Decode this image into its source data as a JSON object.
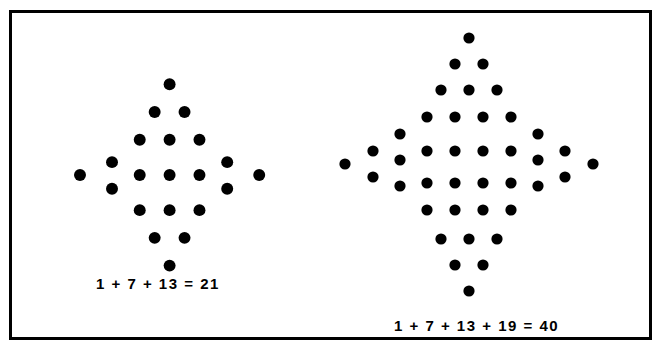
{
  "page": {
    "width": 670,
    "height": 357,
    "background_color": "#ffffff",
    "border_color": "#000000",
    "dot_color": "#000000"
  },
  "figures": [
    {
      "name": "centered-hexagonal-diamond-21",
      "caption": "1 + 7 + 13 = 21",
      "dot_count": 21,
      "dot_radius": 5.6,
      "ring_terms": [
        1,
        7,
        13
      ],
      "sum": 21,
      "origin": {
        "x": 159,
        "y": 164
      },
      "spacing": {
        "dx": 28,
        "dy": 25
      },
      "dots": [
        {
          "x": 159,
          "y": 79
        },
        {
          "x": 145,
          "y": 105
        },
        {
          "x": 173,
          "y": 105
        },
        {
          "x": 131,
          "y": 131
        },
        {
          "x": 159,
          "y": 131
        },
        {
          "x": 187,
          "y": 131
        },
        {
          "x": 105,
          "y": 152
        },
        {
          "x": 105,
          "y": 177
        },
        {
          "x": 213,
          "y": 152
        },
        {
          "x": 213,
          "y": 177
        },
        {
          "x": 75,
          "y": 164
        },
        {
          "x": 243,
          "y": 164
        },
        {
          "x": 131,
          "y": 164
        },
        {
          "x": 159,
          "y": 164
        },
        {
          "x": 187,
          "y": 164
        },
        {
          "x": 131,
          "y": 197
        },
        {
          "x": 159,
          "y": 197
        },
        {
          "x": 187,
          "y": 197
        },
        {
          "x": 145,
          "y": 223
        },
        {
          "x": 173,
          "y": 223
        },
        {
          "x": 159,
          "y": 249
        }
      ]
    },
    {
      "name": "centered-hexagonal-diamond-40",
      "caption": "1 + 7 + 13 + 19 = 40",
      "dot_count": 40,
      "dot_radius": 5.6,
      "ring_terms": [
        1,
        7,
        13,
        19
      ],
      "sum": 40,
      "origin": {
        "x": 469,
        "y": 164
      },
      "spacing": {
        "dx": 28,
        "dy": 25
      },
      "dots": [
        {
          "x": 469,
          "y": 38
        },
        {
          "x": 455,
          "y": 64
        },
        {
          "x": 483,
          "y": 64
        },
        {
          "x": 441,
          "y": 90
        },
        {
          "x": 469,
          "y": 90
        },
        {
          "x": 497,
          "y": 90
        },
        {
          "x": 427,
          "y": 117
        },
        {
          "x": 455,
          "y": 117
        },
        {
          "x": 483,
          "y": 117
        },
        {
          "x": 511,
          "y": 117
        },
        {
          "x": 400,
          "y": 134
        },
        {
          "x": 400,
          "y": 160
        },
        {
          "x": 400,
          "y": 186
        },
        {
          "x": 538,
          "y": 134
        },
        {
          "x": 538,
          "y": 160
        },
        {
          "x": 538,
          "y": 186
        },
        {
          "x": 373,
          "y": 151
        },
        {
          "x": 373,
          "y": 177
        },
        {
          "x": 565,
          "y": 151
        },
        {
          "x": 565,
          "y": 177
        },
        {
          "x": 345,
          "y": 164
        },
        {
          "x": 593,
          "y": 164
        },
        {
          "x": 427,
          "y": 151
        },
        {
          "x": 455,
          "y": 151
        },
        {
          "x": 483,
          "y": 151
        },
        {
          "x": 511,
          "y": 151
        },
        {
          "x": 427,
          "y": 183
        },
        {
          "x": 455,
          "y": 183
        },
        {
          "x": 483,
          "y": 183
        },
        {
          "x": 511,
          "y": 183
        },
        {
          "x": 427,
          "y": 210
        },
        {
          "x": 455,
          "y": 210
        },
        {
          "x": 483,
          "y": 210
        },
        {
          "x": 511,
          "y": 210
        },
        {
          "x": 441,
          "y": 239
        },
        {
          "x": 469,
          "y": 239
        },
        {
          "x": 497,
          "y": 239
        },
        {
          "x": 455,
          "y": 265
        },
        {
          "x": 483,
          "y": 265
        },
        {
          "x": 469,
          "y": 291
        }
      ]
    }
  ]
}
